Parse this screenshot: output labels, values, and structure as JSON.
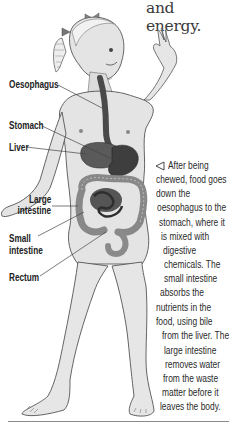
{
  "heading_fragment": "and energy.",
  "labels": {
    "oesophagus": "Oesophagus",
    "stomach": "Stomach",
    "liver": "Liver",
    "large_intestine_1": "Large",
    "large_intestine_2": "intestine",
    "small_intestine_1": "Small",
    "small_intestine_2": "intestine",
    "rectum": "Rectum"
  },
  "caption": {
    "arrow_icon": "left-triangle-pointer",
    "lines": [
      "After being",
      "chewed, food goes",
      "down the",
      "oesophagus to the",
      "stomach, where it",
      "is mixed with",
      "digestive",
      "chemicals. The",
      "small intestine",
      "absorbs the",
      "nutrients in the",
      "food, using bile",
      "from the liver. The",
      "large intestine",
      "removes water",
      "from the waste",
      "matter before it",
      "leaves the body."
    ]
  },
  "colors": {
    "skin": "#e6e6e6",
    "skin_shade": "#c9c9c9",
    "outline": "#555555",
    "organ_dark": "#4a4a4a",
    "organ_mid": "#6e6e6e",
    "intestine": "#9a9a9a",
    "text": "#222222"
  }
}
